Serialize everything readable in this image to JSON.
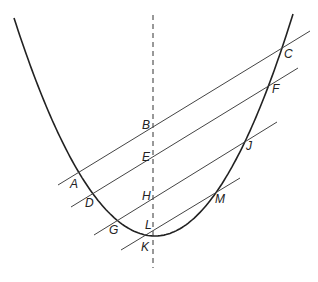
{
  "diagram": {
    "colors": {
      "curve": "#222222",
      "chords": "#444444",
      "axis": "#333333",
      "background": "#ffffff"
    },
    "parabola": {
      "left_top": [
        14,
        18
      ],
      "vertex": [
        155,
        236
      ],
      "right_top": [
        293,
        14
      ]
    },
    "axis": {
      "x": 153,
      "y_start": 15,
      "y_end": 268,
      "style": "dashed"
    },
    "chords": [
      {
        "name": "chord-ABC",
        "from": [
          58,
          185
        ],
        "to": [
          310,
          31
        ],
        "points": [
          "A",
          "B",
          "C"
        ]
      },
      {
        "name": "chord-DEF",
        "from": [
          71,
          207
        ],
        "to": [
          298,
          68
        ],
        "points": [
          "D",
          "E",
          "F"
        ]
      },
      {
        "name": "chord-GHJ",
        "from": [
          94,
          235
        ],
        "to": [
          277,
          122
        ],
        "points": [
          "G",
          "H",
          "J"
        ]
      },
      {
        "name": "chord-KLM",
        "from": [
          121,
          250
        ],
        "to": [
          240,
          178
        ],
        "points": [
          "K",
          "L",
          "M"
        ]
      }
    ],
    "labels": [
      {
        "id": "A",
        "text": "A",
        "x": 70,
        "y": 188
      },
      {
        "id": "B",
        "text": "B",
        "x": 142,
        "y": 129
      },
      {
        "id": "C",
        "text": "C",
        "x": 284,
        "y": 58
      },
      {
        "id": "D",
        "text": "D",
        "x": 85,
        "y": 207
      },
      {
        "id": "E",
        "text": "E",
        "x": 142,
        "y": 161
      },
      {
        "id": "F",
        "text": "F",
        "x": 272,
        "y": 93
      },
      {
        "id": "G",
        "text": "G",
        "x": 109,
        "y": 234
      },
      {
        "id": "H",
        "text": "H",
        "x": 142,
        "y": 200
      },
      {
        "id": "J",
        "text": "J",
        "x": 246,
        "y": 150
      },
      {
        "id": "L",
        "text": "L",
        "x": 145,
        "y": 229
      },
      {
        "id": "K",
        "text": "K",
        "x": 141,
        "y": 251
      },
      {
        "id": "M",
        "text": "M",
        "x": 215,
        "y": 203
      }
    ]
  }
}
